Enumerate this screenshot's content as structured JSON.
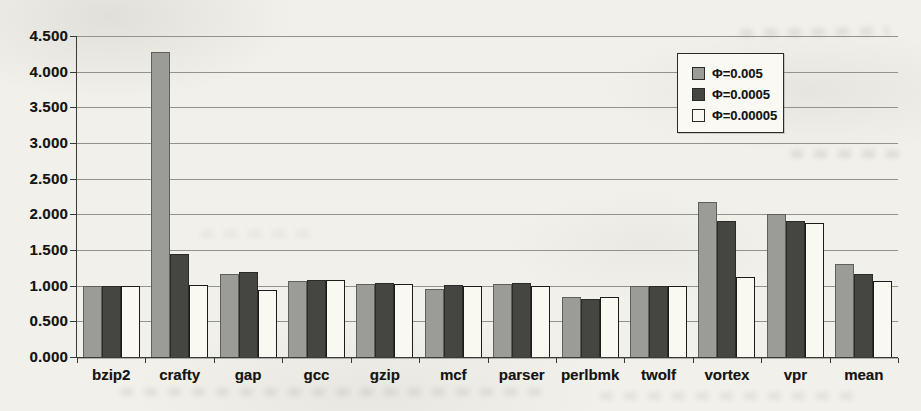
{
  "chart_data": {
    "type": "bar",
    "title": "",
    "xlabel": "",
    "ylabel": "",
    "ylim": [
      0,
      4.5
    ],
    "ytick_step": 0.5,
    "ytick_labels": [
      "0.000",
      "0.500",
      "1.000",
      "1.500",
      "2.000",
      "2.500",
      "3.000",
      "3.500",
      "4.000",
      "4.500"
    ],
    "grid": true,
    "legend_position": "top-right",
    "categories": [
      "bzip2",
      "crafty",
      "gap",
      "gcc",
      "gzip",
      "mcf",
      "parser",
      "perlbmk",
      "twolf",
      "vortex",
      "vpr",
      "mean"
    ],
    "series": [
      {
        "name": "Φ=0.005",
        "color": "#9b9b97",
        "border_color": "#5f5f5b",
        "values": [
          1.0,
          4.28,
          1.16,
          1.07,
          1.02,
          0.96,
          1.02,
          0.84,
          1.0,
          2.18,
          2.0,
          1.3
        ]
      },
      {
        "name": "Φ=0.0005",
        "color": "#454542",
        "border_color": "#2a2a28",
        "values": [
          1.0,
          1.45,
          1.19,
          1.08,
          1.04,
          1.01,
          1.04,
          0.82,
          0.99,
          1.91,
          1.9,
          1.17
        ]
      },
      {
        "name": "Φ=0.00005",
        "color": "#f9f8f1",
        "border_color": "#1c1c1a",
        "values": [
          1.0,
          1.01,
          0.94,
          1.08,
          1.02,
          0.99,
          1.0,
          0.84,
          1.0,
          1.12,
          1.88,
          1.06
        ]
      }
    ],
    "colors": {
      "gridline": "#93938d",
      "axis": "#3a3a36",
      "text": "#151513",
      "legend_background": "#faf9f3",
      "legend_border": "#2a2a28",
      "page_background": "#f1f0ea"
    }
  }
}
